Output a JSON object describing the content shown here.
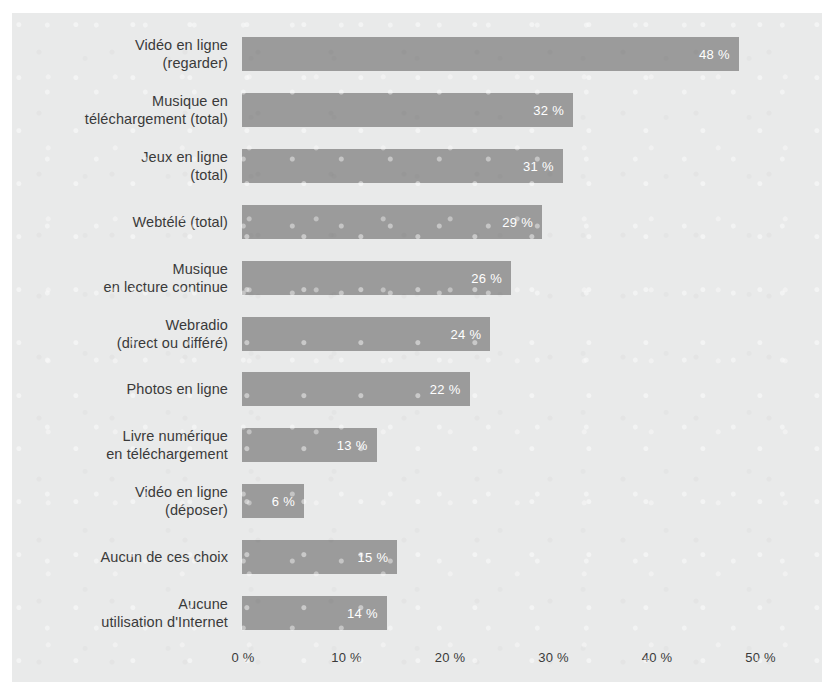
{
  "chart_data": {
    "type": "bar",
    "orientation": "horizontal",
    "title": "",
    "subtitle": "",
    "xlabel": "",
    "ylabel": "",
    "xlim": [
      0,
      52
    ],
    "grid": false,
    "legend": null,
    "value_suffix": " %",
    "categories": [
      "Vidéo en ligne\n(regarder)",
      "Musique en\ntéléchargement (total)",
      "Jeux en ligne\n(total)",
      "Webtélé (total)",
      "Musique\nen lecture continue",
      "Webradio\n(direct ou différé)",
      "Photos en ligne",
      "Livre numérique\nen téléchargement",
      "Vidéo en ligne\n(déposer)",
      "Aucun de ces choix",
      "Aucune\nutilisation d'Internet"
    ],
    "values": [
      48,
      32,
      31,
      29,
      26,
      24,
      22,
      13,
      6,
      15,
      14
    ],
    "value_labels": [
      "48 %",
      "32 %",
      "31 %",
      "29 %",
      "26 %",
      "24 %",
      "22 %",
      "13 %",
      "6 %",
      "15 %",
      "14 %"
    ],
    "xticks": [
      0,
      10,
      20,
      30,
      40,
      50
    ],
    "xtick_labels": [
      "0 %",
      "10 %",
      "20 %",
      "30 %",
      "40 %",
      "50 %"
    ],
    "colors": {
      "bar": "#9b9b9b",
      "bar_value_text": "#ffffff",
      "category_text": "#3a3a3a",
      "tick_text": "#3a3a3a",
      "panel_background": "#e9eaea",
      "page_background": "#ffffff"
    }
  }
}
